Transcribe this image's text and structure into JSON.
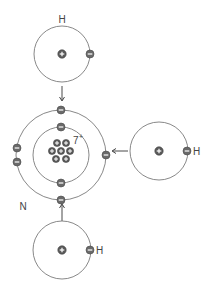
{
  "diagram": {
    "colors": {
      "shell": "#7a7a7a",
      "particle": "#5a5a5a",
      "particle_outline": "#3f3f3f",
      "sign": "#ffffff",
      "arrow": "#333333",
      "text": "#444444"
    },
    "nitrogen": {
      "label": "N",
      "nucleus_charge": "7",
      "nucleus_charge_sign": "+",
      "center": [
        61,
        155
      ],
      "inner_shell_radius": 28,
      "outer_shell_radius": 45,
      "inner_electrons": 2,
      "outer_electrons": 5
    },
    "hydrogens": [
      {
        "id": "top",
        "label": "H",
        "center": [
          62,
          54
        ],
        "radius": 28,
        "electron_side": "right"
      },
      {
        "id": "right",
        "label": "H",
        "center": [
          159,
          151
        ],
        "radius": 29,
        "electron_side": "right"
      },
      {
        "id": "bottom",
        "label": "H",
        "center": [
          62,
          250
        ],
        "radius": 29,
        "electron_side": "right"
      }
    ],
    "arrows": [
      {
        "id": "top-to-n",
        "direction": "down"
      },
      {
        "id": "right-to-n",
        "direction": "left"
      },
      {
        "id": "bottom-to-n",
        "direction": "up"
      }
    ]
  }
}
